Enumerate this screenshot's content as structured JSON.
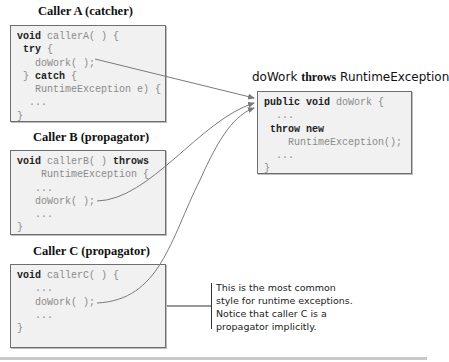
{
  "callerA": {
    "title": "Caller A (catcher)",
    "lines": [
      {
        "kw": "void",
        "rest": " callerA( ) {"
      },
      {
        "kw": " try",
        "rest": " {"
      },
      {
        "kw": "",
        "rest": "   doWork( );"
      },
      {
        "kw": "",
        "rest": " } ",
        "kw2": "catch",
        "rest2": " {"
      },
      {
        "kw": "",
        "rest": "   RuntimeException e) {"
      },
      {
        "kw": "",
        "rest": "  ..."
      },
      {
        "kw": "",
        "rest": "}"
      }
    ]
  },
  "callerB": {
    "title": "Caller B (propagator)",
    "lines": [
      {
        "kw": "void",
        "rest": " callerB( ) ",
        "kw2": "throws",
        "rest2": ""
      },
      {
        "kw": "",
        "rest": "    RuntimeException {"
      },
      {
        "kw": "",
        "rest": "   ..."
      },
      {
        "kw": "",
        "rest": "   doWork( );"
      },
      {
        "kw": "",
        "rest": "   ..."
      },
      {
        "kw": "",
        "rest": "}"
      }
    ]
  },
  "callerC": {
    "title": "Caller C (propagator)",
    "lines": [
      {
        "kw": "void",
        "rest": " callerC( ) {"
      },
      {
        "kw": "",
        "rest": "   ..."
      },
      {
        "kw": "",
        "rest": "   doWork( );"
      },
      {
        "kw": "",
        "rest": "   ..."
      },
      {
        "kw": "",
        "rest": "}"
      }
    ]
  },
  "doWork": {
    "title_pre": "doWork ",
    "title_kw": "throws",
    "title_post": " RuntimeException",
    "lines": [
      {
        "kw": "public void",
        "rest": " doWork {"
      },
      {
        "kw": "",
        "rest": "  ..."
      },
      {
        "kw": " throw new",
        "rest": ""
      },
      {
        "kw": "",
        "rest": "    RuntimeException();"
      },
      {
        "kw": "",
        "rest": "  ..."
      },
      {
        "kw": "",
        "rest": "}"
      }
    ]
  },
  "note": {
    "lines": [
      "This is the most common",
      "style for runtime exceptions.",
      "Notice that caller C is a",
      "propagator implicitly."
    ]
  },
  "colors": {
    "box_fill": "#f1f1f1",
    "box_border": "#6e6e6e",
    "arrow": "#7a7a7a",
    "code_text": "#8a8a8a",
    "keyword": "#222222"
  }
}
